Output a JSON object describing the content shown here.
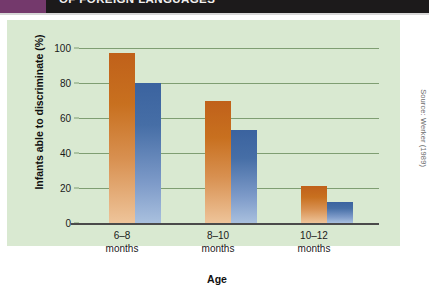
{
  "header": {
    "title": "OF FOREIGN LANGUAGES",
    "accent_color": "#74396c",
    "background_color": "#1c1a1b"
  },
  "source_credit": "Source: Werker (1989)",
  "chart_data": {
    "type": "bar",
    "title": "",
    "subtitle": "",
    "xlabel": "Age",
    "ylabel": "Infants able to discriminate (%)",
    "categories": [
      "6–8\nmonths",
      "8–10\nmonths",
      "10–12\nmonths"
    ],
    "category_lines": [
      [
        "6–8",
        "months"
      ],
      [
        "8–10",
        "months"
      ],
      [
        "10–12",
        "months"
      ]
    ],
    "series": [
      {
        "name": "Hindi contrast",
        "color": "#c4661f",
        "values": [
          97,
          70,
          21
        ]
      },
      {
        "name": "Salish contrast",
        "color": "#47709f",
        "values": [
          80,
          53,
          12
        ]
      }
    ],
    "ylim": [
      0,
      100
    ],
    "yticks": [
      0,
      20,
      40,
      60,
      80,
      100
    ],
    "ytick_labels": [
      "0",
      "20",
      "40",
      "60",
      "80",
      "100"
    ],
    "grid": true,
    "grid_color": "#7f9e72",
    "legend": "none",
    "panel_color": "#d9e9d1",
    "baseline_color": "#4a4a4a"
  }
}
